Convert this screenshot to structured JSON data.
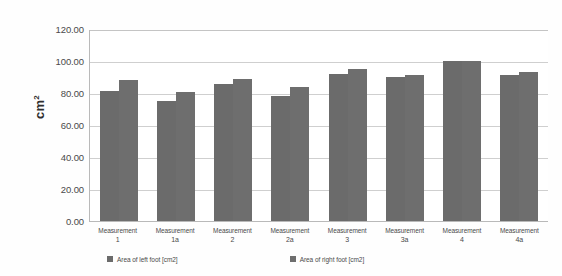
{
  "chart_data": {
    "type": "bar",
    "title": "",
    "xlabel": "",
    "ylabel": "cm2",
    "ylabel_display": "cm",
    "ylabel_superscript": "2",
    "ylim": [
      0,
      120
    ],
    "ytick_step": 20,
    "grid": true,
    "legend_position": "bottom",
    "categories": [
      "Measurement 1",
      "Measurement 1a",
      "Measurement 2",
      "Measurement 2a",
      "Measurement 3",
      "Measurement 3a",
      "Measurement 4",
      "Measurement 4a"
    ],
    "category_lines": [
      {
        "line1": "Measurement",
        "line2": "1"
      },
      {
        "line1": "Measurement",
        "line2": "1a"
      },
      {
        "line1": "Measurement",
        "line2": "2"
      },
      {
        "line1": "Measurement",
        "line2": "2a"
      },
      {
        "line1": "Measurement",
        "line2": "3"
      },
      {
        "line1": "Measurement",
        "line2": "3a"
      },
      {
        "line1": "Measurement",
        "line2": "4"
      },
      {
        "line1": "Measurement",
        "line2": "4a"
      }
    ],
    "ytick_labels": [
      "120.00",
      "100.00",
      "80.00",
      "60.00",
      "40.00",
      "20.00",
      "0.00"
    ],
    "ytick_values": [
      120,
      100,
      80,
      60,
      40,
      20,
      0
    ],
    "series": [
      {
        "name": "Area of left foot [cm2]",
        "color": "#6b6b6b",
        "values": [
          81.0,
          75.0,
          85.5,
          78.0,
          92.0,
          90.0,
          100.0,
          91.0
        ]
      },
      {
        "name": "Area of right foot [cm2]",
        "color": "#6e6e6e",
        "values": [
          88.0,
          80.5,
          89.0,
          84.0,
          95.0,
          91.5,
          100.0,
          93.0
        ]
      }
    ]
  },
  "legend": {
    "items": [
      {
        "label": "Area of left foot [cm2]",
        "color": "#6b6b6b"
      },
      {
        "label": "Area of right foot [cm2]",
        "color": "#6e6e6e"
      }
    ]
  },
  "colors": {
    "bar_left": "#6b6b6b",
    "bar_right": "#6e6e6e",
    "gridline": "#cfcfcf",
    "axis": "#b9b9b9",
    "background": "#fefefe",
    "text": "#4a4a4a"
  }
}
